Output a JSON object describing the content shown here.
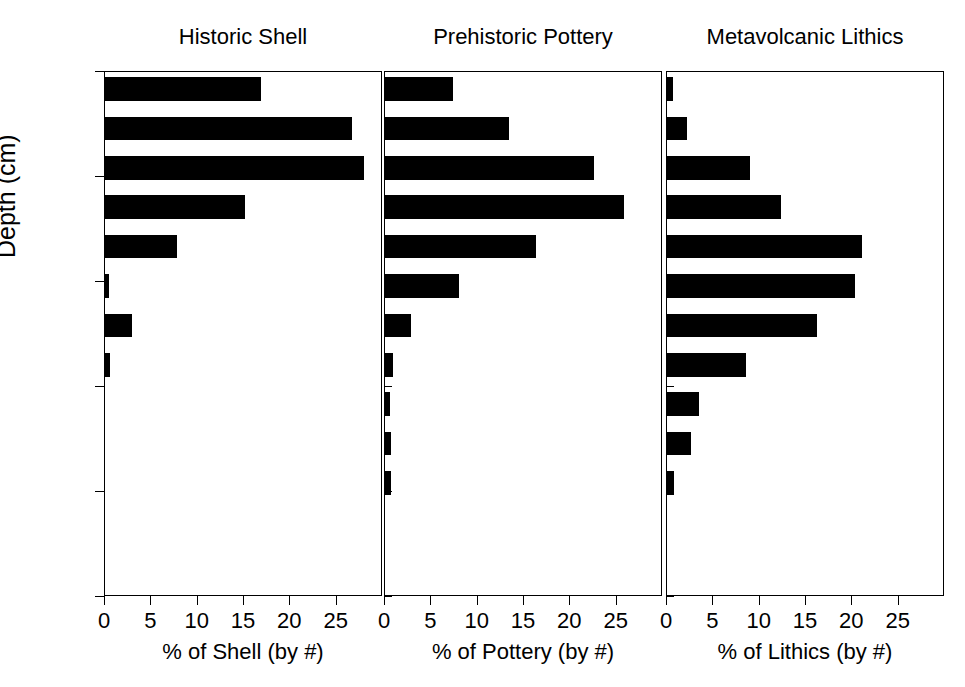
{
  "figure": {
    "y_axis_title": "Depth (cm)",
    "y_ticks": [
      "0",
      "20",
      "40",
      "60",
      "80",
      "100"
    ],
    "x_ticks": [
      "0",
      "5",
      "10",
      "15",
      "20",
      "25"
    ]
  },
  "chart_data": {
    "type": "bar",
    "orientation": "horizontal",
    "title": "",
    "ylabel": "Depth (cm)",
    "ylim": [
      0,
      100
    ],
    "ylim_inverted": true,
    "xlim": [
      0,
      30
    ],
    "grid": false,
    "legend": "none",
    "y_tick_values": [
      0,
      20,
      40,
      60,
      80,
      100
    ],
    "x_tick_values": [
      0,
      5,
      10,
      15,
      20,
      25
    ],
    "panels": [
      {
        "title": "Historic Shell",
        "xlabel": "% of Shell (by #)",
        "depth_bins": [
          [
            1.0,
            5.5
          ],
          [
            8.5,
            13.0
          ],
          [
            16.0,
            20.5
          ],
          [
            23.5,
            28.0
          ],
          [
            31.0,
            35.5
          ],
          [
            38.5,
            43.0
          ],
          [
            46.0,
            50.5
          ],
          [
            53.5,
            58.0
          ]
        ],
        "values": [
          16.8,
          26.7,
          27.9,
          15.1,
          7.8,
          0.4,
          2.9,
          0.5
        ]
      },
      {
        "title": "Prehistoric Pottery",
        "xlabel": "% of Pottery (by #)",
        "depth_bins": [
          [
            1.0,
            5.5
          ],
          [
            8.5,
            13.0
          ],
          [
            16.0,
            20.5
          ],
          [
            23.5,
            28.0
          ],
          [
            31.0,
            35.5
          ],
          [
            38.5,
            43.0
          ],
          [
            46.0,
            50.5
          ],
          [
            53.5,
            58.0
          ],
          [
            61.0,
            65.5
          ],
          [
            68.5,
            73.0
          ],
          [
            76.0,
            80.5
          ]
        ],
        "values": [
          7.3,
          13.4,
          22.6,
          25.8,
          16.3,
          8.0,
          2.8,
          0.9,
          0.5,
          0.6,
          0.7
        ]
      },
      {
        "title": "Metavolcanic Lithics",
        "xlabel": "% of Lithics (by #)",
        "depth_bins": [
          [
            1.0,
            5.5
          ],
          [
            8.5,
            13.0
          ],
          [
            16.0,
            20.5
          ],
          [
            23.5,
            28.0
          ],
          [
            31.0,
            35.5
          ],
          [
            38.5,
            43.0
          ],
          [
            46.0,
            50.5
          ],
          [
            53.5,
            58.0
          ],
          [
            61.0,
            65.5
          ],
          [
            68.5,
            73.0
          ],
          [
            76.0,
            80.5
          ]
        ],
        "values": [
          0.7,
          2.2,
          9.0,
          12.3,
          21.0,
          20.3,
          16.2,
          8.5,
          3.5,
          2.6,
          0.8
        ]
      }
    ]
  }
}
